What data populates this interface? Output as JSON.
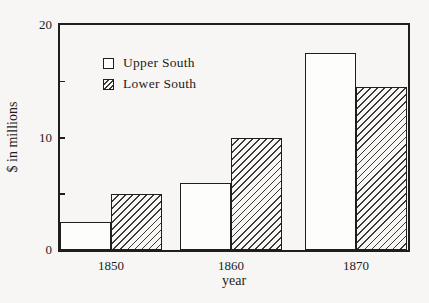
{
  "chart_data": {
    "type": "bar",
    "title": "",
    "categories": [
      "1850",
      "1860",
      "1870"
    ],
    "series": [
      {
        "name": "Upper South",
        "fill": "solid-white",
        "values": [
          2.5,
          6,
          17.5
        ]
      },
      {
        "name": "Lower South",
        "fill": "diagonal-hatch",
        "values": [
          5,
          10,
          14.5
        ]
      }
    ],
    "xlabel": "year",
    "ylabel": "$ in millions",
    "ylim": [
      0,
      20
    ],
    "ytick_labels": [
      "0",
      "10",
      "20"
    ],
    "ytick_label_values": [
      0,
      10,
      20
    ],
    "yticks_inner": [
      5,
      10,
      15
    ],
    "grid": false,
    "legend_position": "upper-left-inside"
  },
  "colors": {
    "background": "#f7f6f4",
    "frame": "#1e1e1e",
    "bar_fill": "#fdfdfb",
    "hatch": "#3a3a3a",
    "text": "#1c1c1c"
  }
}
